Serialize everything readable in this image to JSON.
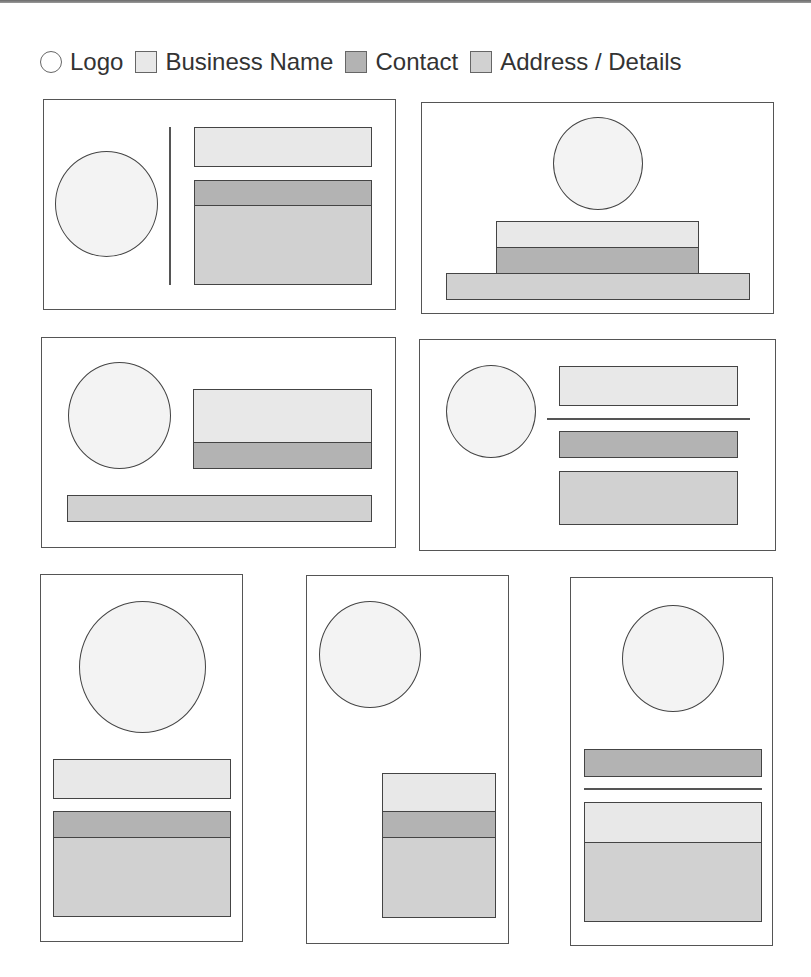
{
  "legend": {
    "items": [
      {
        "label": "Logo",
        "shape": "circle",
        "color": "#ffffff"
      },
      {
        "label": "Business Name",
        "shape": "square",
        "color": "#e8e8e8"
      },
      {
        "label": "Contact",
        "shape": "square",
        "color": "#b3b3b3"
      },
      {
        "label": "Address / Details",
        "shape": "square",
        "color": "#d1d1d1"
      }
    ]
  },
  "colors": {
    "logo": "#f3f3f3",
    "business_name": "#e8e8e8",
    "contact": "#b3b3b3",
    "address_details": "#d1d1d1",
    "outline": "#444444"
  },
  "layouts": [
    {
      "id": 1,
      "orientation": "landscape",
      "description": "Logo left, vertical divider, name above contact+address block"
    },
    {
      "id": 2,
      "orientation": "landscape",
      "description": "Logo centered top, stacked name/contact, wide address bar"
    },
    {
      "id": 3,
      "orientation": "landscape",
      "description": "Logo left, name+contact block right, address bar bottom"
    },
    {
      "id": 4,
      "orientation": "landscape",
      "description": "Logo left, name, horizontal divider, contact, address"
    },
    {
      "id": 5,
      "orientation": "portrait",
      "description": "Large logo top, name, contact+address block"
    },
    {
      "id": 6,
      "orientation": "portrait",
      "description": "Logo top-left, name/contact/address block bottom-right"
    },
    {
      "id": 7,
      "orientation": "portrait",
      "description": "Logo top, contact, divider, name+address block"
    }
  ]
}
